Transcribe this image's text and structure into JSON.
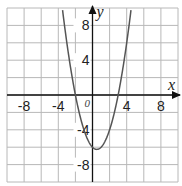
{
  "chart_data": {
    "type": "line",
    "title": "",
    "xlabel": "x",
    "ylabel": "y",
    "origin_label": "0",
    "xlim": [
      -10,
      10
    ],
    "ylim": [
      -10,
      10
    ],
    "grid": true,
    "grid_step": 2,
    "x_ticks": [
      {
        "value": -8,
        "label": "-8"
      },
      {
        "value": -4,
        "label": "-4"
      },
      {
        "value": 4,
        "label": "4"
      },
      {
        "value": 8,
        "label": "8"
      }
    ],
    "y_ticks": [
      {
        "value": 8,
        "label": "8"
      },
      {
        "value": 4,
        "label": "4"
      },
      {
        "value": -4,
        "label": "-4"
      },
      {
        "value": -8,
        "label": "-8"
      }
    ],
    "series": [
      {
        "name": "parabola",
        "equation": "y = x^2 - x - 6",
        "coefficients": {
          "a": 1,
          "b": -1,
          "c": -6
        },
        "x_intercepts": [
          -2,
          3
        ],
        "y_intercept": -6,
        "vertex": [
          0.5,
          -6.25
        ],
        "color": "#555555"
      }
    ],
    "colors": {
      "grid": "#b8b8b8",
      "axes": "#111111",
      "curve": "#555555",
      "frame": "#bdbdbd"
    }
  }
}
